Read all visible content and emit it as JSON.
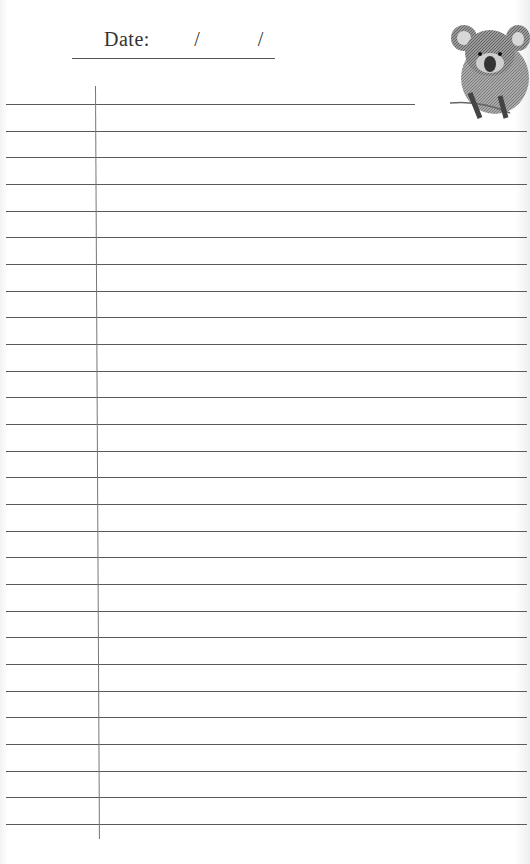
{
  "header": {
    "date_label": "Date:",
    "date_separator_1": "/",
    "date_separator_2": "/"
  },
  "decoration": {
    "image": "koala-illustration"
  },
  "ruling": {
    "line_count": 28,
    "first_line_y": 104,
    "spacing": 26.67,
    "margin_line_x": 95,
    "line_color": "#5a5a5a"
  }
}
